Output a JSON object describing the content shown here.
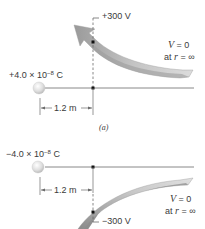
{
  "panel_a": {
    "charge_label": "+4.0 × 10",
    "charge_exp": "−8",
    "charge_unit": " C",
    "potential_label": "+300 V",
    "v_zero_label_v": "V",
    "v_zero_label_eq": " = 0",
    "at_inf_prefix": "at ",
    "at_inf_r": "r",
    "at_inf_suffix": " = ∞",
    "distance_label": "1.2 m",
    "caption": "(a)"
  },
  "panel_b": {
    "charge_label": "−4.0 × 10",
    "charge_exp": "−8",
    "charge_unit": " C",
    "potential_label": "−300 V",
    "v_zero_label_v": "V",
    "v_zero_label_eq": " = 0",
    "at_inf_prefix": "at ",
    "at_inf_r": "r",
    "at_inf_suffix": " = ∞",
    "distance_label": "1.2 m"
  },
  "colors": {
    "line": "#6a6a6a",
    "arrow_fill": "#b8b8b8",
    "arrow_shade": "#8f8f8f",
    "sphere": "#d9d9d9",
    "dot": "#111111"
  }
}
